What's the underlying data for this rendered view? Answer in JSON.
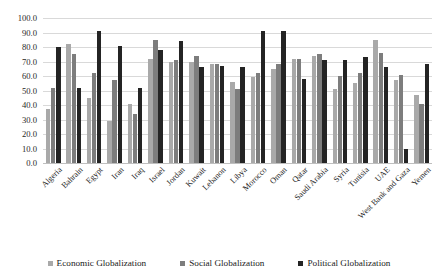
{
  "chart_data": {
    "type": "bar",
    "title": "",
    "xlabel": "",
    "ylabel": "",
    "ylim": [
      0,
      100
    ],
    "ytick_step": 10,
    "ytick_labels": [
      "0.0",
      "10.0",
      "20.0",
      "30.0",
      "40.0",
      "50.0",
      "60.0",
      "70.0",
      "80.0",
      "90.0",
      "100.0"
    ],
    "grid": true,
    "legend_position": "bottom",
    "categories": [
      "Algeria",
      "Bahrain",
      "Egypt",
      "Iran",
      "Iraq",
      "Israel",
      "Jordan",
      "Kuwait",
      "Lebanon",
      "Libya",
      "Morocco",
      "Oman",
      "Qatar",
      "Saudi Arabia",
      "Syria",
      "Tunisia",
      "UAE",
      "West Bank and Gaza",
      "Yemen"
    ],
    "series": [
      {
        "name": "Economic Globalization",
        "color": "#a9a9a9",
        "values": [
          37.0,
          82.0,
          45.0,
          29.0,
          41.0,
          72.0,
          70.0,
          70.0,
          68.0,
          56.0,
          59.0,
          65.0,
          72.0,
          74.0,
          51.0,
          55.0,
          85.0,
          57.0,
          47.0
        ]
      },
      {
        "name": "Social Globalization",
        "color": "#7d7d7d",
        "values": [
          52.0,
          75.0,
          62.0,
          57.0,
          34.0,
          85.0,
          71.0,
          74.0,
          68.0,
          51.0,
          62.0,
          68.0,
          72.0,
          75.0,
          60.0,
          62.0,
          76.0,
          61.0,
          41.0
        ]
      },
      {
        "name": "Political Globalization",
        "color": "#242424",
        "values": [
          80.0,
          52.0,
          91.0,
          81.0,
          52.0,
          78.0,
          84.0,
          66.0,
          67.0,
          66.0,
          91.0,
          91.0,
          58.0,
          71.0,
          71.0,
          73.0,
          66.0,
          10.0,
          68.0
        ]
      }
    ]
  }
}
